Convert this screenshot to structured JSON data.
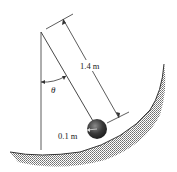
{
  "figure": {
    "type": "pendulum-ball-on-curved-surface",
    "labels": {
      "length": "1.4 m",
      "radius": "0.1 m",
      "angle": "θ"
    },
    "colors": {
      "line": "#333333",
      "ball_dark": "#2a2a2a",
      "ball_light": "#7a7a7a",
      "ground_shade": "#555555",
      "background": "#ffffff"
    }
  }
}
